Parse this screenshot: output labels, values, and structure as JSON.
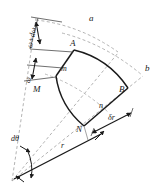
{
  "figure": {
    "type": "geometry-diagram",
    "background_color": "#ffffff",
    "ink_color": "#1a1a1a",
    "dashed_color": "#9a9a9a"
  },
  "labels": {
    "omega_plus_domega": "ω+dω",
    "omega": "ω",
    "arc_a": "a",
    "arc_b": "b",
    "vertex_A": "A",
    "vertex_B": "B",
    "vertex_M": "M",
    "vertex_N": "N",
    "point_m": "m",
    "point_n": "n",
    "delta_r": "δr",
    "d_theta": "dθ",
    "radius_r": "r"
  },
  "geometry": {
    "origin": {
      "x": 12,
      "y": 181
    },
    "vertices": {
      "A": {
        "x": 74,
        "y": 50
      },
      "B": {
        "x": 128,
        "y": 88
      },
      "N": {
        "x": 84,
        "y": 126
      },
      "M": {
        "x": 48,
        "y": 79
      }
    },
    "inner_points": {
      "m": {
        "x": 63,
        "y": 69
      },
      "n": {
        "x": 100,
        "y": 103
      }
    },
    "dimension_arrows": [
      {
        "name": "omega-plus-domega-arrow",
        "label": "ω+dω"
      },
      {
        "name": "omega-arrow",
        "label": "ω"
      },
      {
        "name": "delta-r-arrow",
        "label": "δr"
      },
      {
        "name": "d-theta-arrow",
        "label": "dθ"
      },
      {
        "name": "radius-arrow",
        "label": "r"
      }
    ]
  }
}
